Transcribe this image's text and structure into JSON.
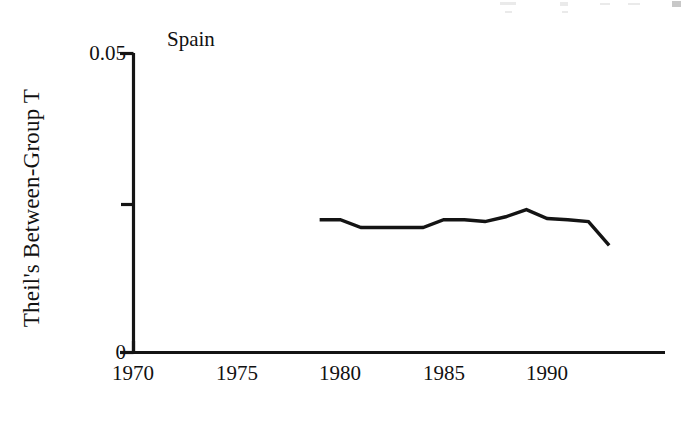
{
  "chart_data": {
    "type": "line",
    "title": "Spain",
    "xlabel": "",
    "ylabel": "Theil's Between-Group T",
    "xlim": [
      1970,
      1995.7
    ],
    "ylim": [
      0,
      0.05
    ],
    "grid": false,
    "legend": "none",
    "x_ticks": [
      {
        "value": 1970,
        "label": "1970"
      },
      {
        "value": 1975,
        "label": "1975"
      },
      {
        "value": 1980,
        "label": "1980"
      },
      {
        "value": 1985,
        "label": "1985"
      },
      {
        "value": 1990,
        "label": "1990"
      }
    ],
    "y_ticks": [
      {
        "value": 0,
        "label": "0"
      },
      {
        "value": 0.025,
        "label": ""
      },
      {
        "value": 0.05,
        "label": "0.05"
      }
    ],
    "series": [
      {
        "name": "Spain",
        "color": "#141414",
        "x": [
          1979,
          1980,
          1981,
          1982,
          1983,
          1984,
          1985,
          1986,
          1987,
          1988,
          1989,
          1990,
          1991,
          1992,
          1993
        ],
        "values": [
          0.0222,
          0.0222,
          0.0209,
          0.0209,
          0.0209,
          0.0209,
          0.0222,
          0.0222,
          0.0219,
          0.0227,
          0.0239,
          0.0224,
          0.0222,
          0.0219,
          0.0179
        ]
      }
    ]
  },
  "axes": {
    "top_tick_label": "0.05",
    "bottom_tick_label": "0",
    "x_tick_labels": [
      "1970",
      "1975",
      "1980",
      "1985",
      "1990"
    ],
    "y_axis_title": "Theil's Between-Group T",
    "panel_title": "Spain"
  }
}
